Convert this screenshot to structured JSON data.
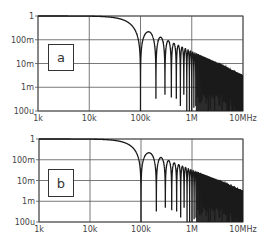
{
  "chart_data": [
    {
      "type": "line",
      "panel_label": "a",
      "title": "",
      "xlabel": "",
      "ylabel": "",
      "x_scale": "log",
      "y_scale": "log",
      "xlim": [
        1000,
        10000000
      ],
      "ylim": [
        0.0001,
        1
      ],
      "x_ticks": [
        "1k",
        "10k",
        "100k",
        "1M",
        "10MHz"
      ],
      "y_ticks": [
        "1",
        "100m",
        "10m",
        "1m",
        "100u"
      ],
      "grid": true,
      "legend": null,
      "series": [
        {
          "name": "|sinc| magnitude response",
          "function": "|sin(pi*f/f0)/(pi*f/f0)|",
          "f0_hz": 100000,
          "description": "Flat at 1 up to ~20kHz, rolls off to first null at 100kHz, nulls at every multiple of 100kHz, sidelobe envelope decaying as 1/(pi*f/f0) to ~3m at 10MHz",
          "x": [
            1000,
            10000,
            30000,
            50000,
            100000,
            150000,
            250000,
            350000,
            1000000,
            10000000
          ],
          "y": [
            1.0,
            0.998,
            0.985,
            0.64,
            0.0,
            0.21,
            0.127,
            0.091,
            0.032,
            0.0032
          ]
        }
      ]
    },
    {
      "type": "line",
      "panel_label": "b",
      "title": "",
      "xlabel": "",
      "ylabel": "",
      "x_scale": "log",
      "y_scale": "log",
      "xlim": [
        1000,
        10000000
      ],
      "ylim": [
        0.0001,
        1
      ],
      "x_ticks": [
        "1k",
        "10k",
        "100k",
        "1M",
        "10MHz"
      ],
      "y_ticks": [
        "1",
        "100m",
        "10m",
        "1m",
        "100u"
      ],
      "grid": true,
      "legend": null,
      "series": [
        {
          "name": "|sinc| magnitude response",
          "function": "|sin(pi*f/f0)/(pi*f/f0)|",
          "f0_hz": 100000,
          "description": "Same sinc response as panel a: flat to ~20kHz, nulls at multiples of 100kHz, 1/f sidelobe envelope",
          "x": [
            1000,
            10000,
            30000,
            50000,
            100000,
            150000,
            250000,
            350000,
            1000000,
            10000000
          ],
          "y": [
            1.0,
            0.998,
            0.985,
            0.64,
            0.0,
            0.21,
            0.127,
            0.091,
            0.032,
            0.0032
          ]
        }
      ]
    }
  ],
  "panels": [
    {
      "label": "a",
      "frame": {
        "left": 38,
        "top": 16,
        "right": 243,
        "bottom": 111
      },
      "box": {
        "left": 48,
        "top": 44,
        "width": 26,
        "height": 27
      }
    },
    {
      "label": "b",
      "frame": {
        "left": 39,
        "top": 139,
        "right": 243,
        "bottom": 222
      },
      "box": {
        "left": 48,
        "top": 169,
        "width": 26,
        "height": 28
      }
    }
  ],
  "colors": {
    "line": "#1a1a1a",
    "grid": "#555555",
    "frame": "#555555",
    "text": "#444444"
  }
}
